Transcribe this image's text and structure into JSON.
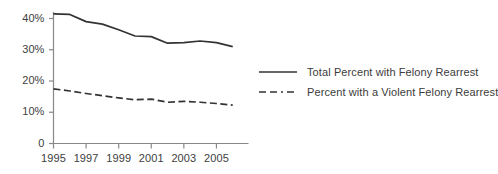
{
  "chart_data": {
    "type": "line",
    "title": "",
    "xlabel": "",
    "ylabel": "",
    "x": [
      1995,
      1996,
      1997,
      1998,
      1999,
      2000,
      2001,
      2002,
      2003,
      2004,
      2005,
      2006
    ],
    "xlim": [
      1995,
      2006.6
    ],
    "ylim": [
      0,
      44
    ],
    "grid": false,
    "legend_position": "right",
    "y_tick_labels": [
      "0",
      "10%",
      "20%",
      "30%",
      "40%"
    ],
    "y_tick_values": [
      0,
      10,
      20,
      30,
      40
    ],
    "x_tick_labels": [
      "1995",
      "1997",
      "1999",
      "2001",
      "2003",
      "2005"
    ],
    "x_tick_values": [
      1995,
      1997,
      1999,
      2001,
      2003,
      2005
    ],
    "series": [
      {
        "name": "Total Percent with Felony Rearrest",
        "style": "solid",
        "color": "#333333",
        "values": [
          41.5,
          41.3,
          39.0,
          38.2,
          36.4,
          34.4,
          34.2,
          32.1,
          32.3,
          32.8,
          32.3,
          31.0
        ]
      },
      {
        "name": "Percent with a Violent Felony Rearrest",
        "style": "dashed",
        "color": "#333333",
        "values": [
          17.5,
          16.8,
          16.0,
          15.3,
          14.6,
          14.0,
          14.2,
          13.2,
          13.5,
          13.2,
          12.8,
          12.3
        ]
      }
    ]
  },
  "legend": {
    "items": [
      {
        "label": "Total Percent with Felony Rearrest",
        "style": "solid"
      },
      {
        "label": "Percent with a Violent Felony Rearrest",
        "style": "dashed"
      }
    ]
  }
}
